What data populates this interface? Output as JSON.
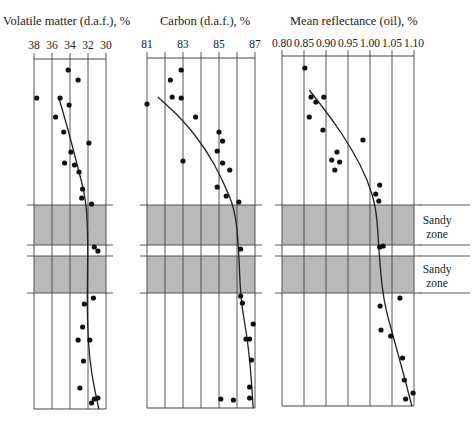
{
  "chart_data": [
    {
      "type": "scatter",
      "title": "Volatile matter (d.a.f.), %",
      "xlabel": "Volatile matter (d.a.f.), %",
      "ylabel": "",
      "xlim": [
        38,
        30
      ],
      "x_ticks": [
        "38",
        "36",
        "34",
        "32",
        "30"
      ],
      "axis_reversed": true,
      "grid": true,
      "points": [
        [
          34.2,
          70
        ],
        [
          33.1,
          80
        ],
        [
          37.7,
          98
        ],
        [
          35.1,
          98
        ],
        [
          34.1,
          105
        ],
        [
          35.6,
          117
        ],
        [
          34.7,
          132
        ],
        [
          31.9,
          143
        ],
        [
          33.9,
          152
        ],
        [
          34.6,
          163
        ],
        [
          33.5,
          165
        ],
        [
          33.0,
          172
        ],
        [
          32.6,
          189
        ],
        [
          32.7,
          198
        ],
        [
          31.6,
          204
        ],
        [
          31.3,
          247
        ],
        [
          30.9,
          251
        ],
        [
          31.4,
          298
        ],
        [
          32.4,
          304
        ],
        [
          32.6,
          327
        ],
        [
          33.1,
          340
        ],
        [
          31.8,
          340
        ],
        [
          32.5,
          361
        ],
        [
          32.9,
          388
        ],
        [
          31.3,
          399
        ],
        [
          30.9,
          398
        ],
        [
          31.6,
          403
        ]
      ],
      "trend_line": [
        [
          35.3,
          96
        ],
        [
          34.2,
          130
        ],
        [
          33.2,
          165
        ],
        [
          32.2,
          200
        ],
        [
          32.0,
          240
        ],
        [
          32.1,
          300
        ],
        [
          32.0,
          340
        ],
        [
          31.6,
          375
        ],
        [
          30.8,
          409
        ]
      ]
    },
    {
      "type": "scatter",
      "title": "Carbon (d.a.f.), %",
      "xlabel": "Carbon (d.a.f.), %",
      "ylabel": "",
      "xlim": [
        81,
        87
      ],
      "x_ticks": [
        "81",
        "83",
        "85",
        "87"
      ],
      "grid": true,
      "points": [
        [
          82.9,
          70
        ],
        [
          82.3,
          80
        ],
        [
          81.0,
          104
        ],
        [
          82.4,
          97
        ],
        [
          82.9,
          98
        ],
        [
          83.7,
          117
        ],
        [
          85.0,
          132
        ],
        [
          85.2,
          141
        ],
        [
          84.9,
          151
        ],
        [
          83.0,
          161
        ],
        [
          85.2,
          163
        ],
        [
          85.6,
          170
        ],
        [
          84.9,
          187
        ],
        [
          85.4,
          196
        ],
        [
          86.1,
          202
        ],
        [
          86.2,
          249
        ],
        [
          86.2,
          296
        ],
        [
          86.3,
          303
        ],
        [
          86.9,
          324
        ],
        [
          86.5,
          339
        ],
        [
          86.7,
          339
        ],
        [
          86.8,
          360
        ],
        [
          86.7,
          387
        ],
        [
          85.1,
          399
        ],
        [
          85.8,
          400
        ],
        [
          86.7,
          398
        ]
      ],
      "trend_line": [
        [
          81.6,
          97
        ],
        [
          83.0,
          120
        ],
        [
          84.3,
          150
        ],
        [
          85.2,
          180
        ],
        [
          85.9,
          210
        ],
        [
          86.1,
          250
        ],
        [
          86.2,
          300
        ],
        [
          86.6,
          340
        ],
        [
          86.8,
          380
        ],
        [
          86.9,
          408
        ]
      ]
    },
    {
      "type": "scatter",
      "title": "Mean reflectance (oil), %",
      "xlabel": "Mean reflectance (oil), %",
      "ylabel": "",
      "xlim": [
        0.8,
        1.1
      ],
      "x_ticks": [
        "0.80",
        "0.85",
        "0.90",
        "0.95",
        "1.00",
        "1.05",
        "1.10"
      ],
      "grid": true,
      "points": [
        [
          0.852,
          68
        ],
        [
          0.866,
          97
        ],
        [
          0.877,
          102
        ],
        [
          0.895,
          97
        ],
        [
          0.862,
          117
        ],
        [
          0.893,
          130
        ],
        [
          0.984,
          140
        ],
        [
          0.925,
          152
        ],
        [
          0.913,
          160
        ],
        [
          0.931,
          162
        ],
        [
          0.92,
          170
        ],
        [
          1.022,
          185
        ],
        [
          1.013,
          194
        ],
        [
          1.02,
          201
        ],
        [
          1.022,
          247
        ],
        [
          1.03,
          246
        ],
        [
          1.068,
          298
        ],
        [
          1.023,
          306
        ],
        [
          1.025,
          330
        ],
        [
          1.047,
          336
        ],
        [
          1.074,
          358
        ],
        [
          1.078,
          380
        ],
        [
          1.098,
          393
        ],
        [
          1.081,
          399
        ]
      ],
      "trend_line": [
        [
          0.862,
          90
        ],
        [
          0.915,
          120
        ],
        [
          0.96,
          150
        ],
        [
          0.995,
          180
        ],
        [
          1.015,
          210
        ],
        [
          1.02,
          250
        ],
        [
          1.03,
          300
        ],
        [
          1.055,
          340
        ],
        [
          1.08,
          380
        ],
        [
          1.095,
          406
        ]
      ]
    }
  ],
  "panels": {
    "vm": {
      "title": "Volatile matter (d.a.f.), %",
      "ticks": [
        "38",
        "36",
        "34",
        "32",
        "30"
      ]
    },
    "carbon": {
      "title": "Carbon (d.a.f.), %",
      "ticks": [
        "81",
        "83",
        "85",
        "87"
      ]
    },
    "reflectance": {
      "title": "Mean reflectance (oil), %",
      "ticks": [
        "0.80",
        "0.85",
        "0.90",
        "0.95",
        "1.00",
        "1.05",
        "1.10"
      ]
    }
  },
  "zones": [
    {
      "line1": "Sandy",
      "line2": "zone"
    },
    {
      "line1": "Sandy",
      "line2": "zone"
    }
  ],
  "colors": {
    "shade": "#b9b9b9",
    "line": "#444444",
    "dot": "#111111"
  }
}
